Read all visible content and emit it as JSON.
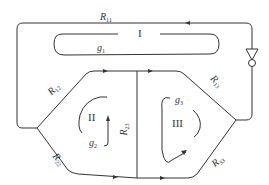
{
  "diagram": {
    "type": "flow network / loop diagram",
    "line_color": "#333333",
    "loops": [
      {
        "id": "I",
        "label": "I",
        "gain_label": "g",
        "gain_sub": "1"
      },
      {
        "id": "II",
        "label": "II",
        "gain_label": "g",
        "gain_sub": "2"
      },
      {
        "id": "III",
        "label": "III",
        "gain_label": "g",
        "gain_sub": "3"
      }
    ],
    "branches": [
      {
        "id": "R11",
        "label": "R",
        "sub": "11"
      },
      {
        "id": "R12",
        "label": "R",
        "sub": "12"
      },
      {
        "id": "R13",
        "label": "R",
        "sub": "13"
      },
      {
        "id": "R22",
        "label": "R",
        "sub": "22"
      },
      {
        "id": "R23",
        "label": "R",
        "sub": "23"
      },
      {
        "id": "R33",
        "label": "R",
        "sub": "33"
      }
    ],
    "element": "fan symbol on right branch"
  }
}
